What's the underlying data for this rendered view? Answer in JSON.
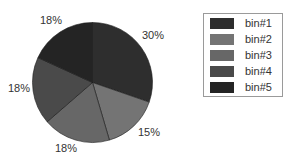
{
  "chart_data": {
    "type": "pie",
    "title": "",
    "categories": [
      "bin#1",
      "bin#2",
      "bin#3",
      "bin#4",
      "bin#5"
    ],
    "values": [
      30,
      15,
      18,
      18,
      18
    ],
    "labels": [
      "30%",
      "15%",
      "18%",
      "18%",
      "18%"
    ],
    "colors": [
      "#2e2e2e",
      "#747474",
      "#676767",
      "#4a4a4a",
      "#242424"
    ],
    "start_angle_deg": 0,
    "direction": "clockwise",
    "legend_position": "right",
    "legend_entries": [
      "bin#1",
      "bin#2",
      "bin#3",
      "bin#4",
      "bin#5"
    ]
  },
  "pie": {
    "cx": 92.5,
    "cy": 82.5,
    "r": 60
  },
  "label_positions": [
    {
      "text": "30%",
      "left": 142,
      "top": 29
    },
    {
      "text": "15%",
      "left": 138,
      "top": 126
    },
    {
      "text": "18%",
      "left": 55,
      "top": 142
    },
    {
      "text": "18%",
      "left": 8,
      "top": 82
    },
    {
      "text": "18%",
      "left": 40,
      "top": 14
    }
  ]
}
